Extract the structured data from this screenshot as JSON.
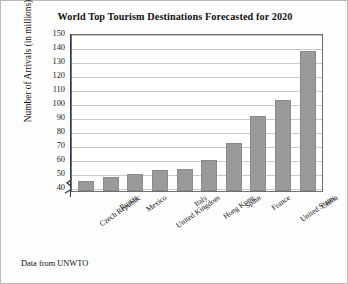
{
  "figure": {
    "title": "World Top Tourism Destinations Forecasted for 2020",
    "footnote": "Data from UNWTO",
    "bar_color": "#9a9a9a",
    "frame_color": "#6e6e6e",
    "grid_color": "#c8c8c8"
  },
  "chart_data": {
    "type": "bar",
    "title": "World Top Tourism Destinations Forecasted for 2020",
    "xlabel": "",
    "ylabel": "Number of Arrivals (in millions)",
    "ylim": [
      37,
      150
    ],
    "yticks": [
      40,
      50,
      60,
      70,
      80,
      90,
      100,
      110,
      120,
      130,
      140,
      150
    ],
    "grid": true,
    "legend": "none",
    "axis_break": true,
    "categories": [
      "Czech Republic",
      "Russia",
      "Mexico",
      "United Kingdom",
      "Italy",
      "Hong Kong",
      "Spain",
      "France",
      "United States",
      "China"
    ],
    "values": [
      44,
      47,
      49,
      52,
      53,
      59,
      71,
      91,
      102,
      137
    ],
    "annotations": [
      "Data from UNWTO"
    ]
  }
}
